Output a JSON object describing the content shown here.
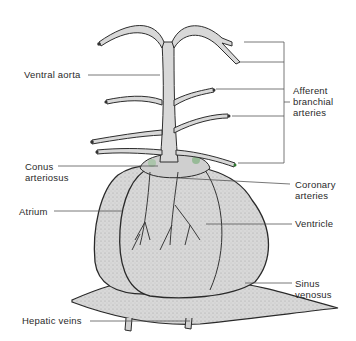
{
  "diagram": {
    "labels": {
      "ventral_aorta": "Ventral aorta",
      "afferent_line1": "Afferent",
      "afferent_line2": "branchial",
      "afferent_line3": "arteries",
      "conus_line1": "Conus",
      "conus_line2": "arteriosus",
      "coronary_line1": "Coronary",
      "coronary_line2": "arteries",
      "atrium": "Atrium",
      "ventricle": "Ventricle",
      "sinus_line1": "Sinus",
      "sinus_line2": "venosus",
      "hepatic_veins": "Hepatic veins"
    },
    "colors": {
      "tissue_fill": "#d6d6d6",
      "outline": "#2e2e2e",
      "leader_line": "#555555",
      "background": "#ffffff"
    }
  }
}
